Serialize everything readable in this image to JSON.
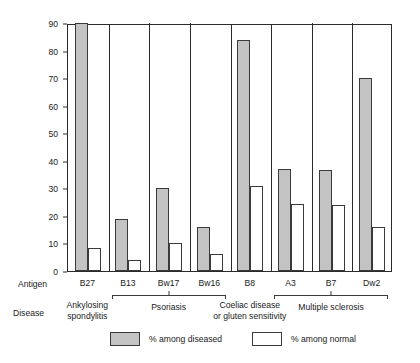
{
  "chart_data": {
    "type": "bar",
    "title": "",
    "xlabel": "",
    "ylabel": "Percentage having antigen",
    "ylim": [
      0,
      90
    ],
    "ytick_labels": [
      "0",
      "10",
      "20",
      "30",
      "40",
      "50",
      "60",
      "70",
      "80",
      "90"
    ],
    "yticks": [
      0,
      10,
      20,
      30,
      40,
      50,
      60,
      70,
      80,
      90
    ],
    "grid": false,
    "legend_position": "bottom",
    "categories": [
      "B27",
      "B13",
      "Bw17",
      "Bw16",
      "B8",
      "A3",
      "B7",
      "Dw2"
    ],
    "series": [
      {
        "name": "% among diseased",
        "color": "#c3c3c3",
        "values": [
          90,
          19,
          30,
          16,
          84,
          37,
          36.5,
          70
        ]
      },
      {
        "name": "% among normal",
        "color": "#ffffff",
        "values": [
          8.5,
          4,
          10,
          6,
          31,
          24.5,
          24,
          16
        ]
      }
    ],
    "row_labels": {
      "antigen": "Antigen",
      "disease": "Disease"
    },
    "groups": [
      {
        "disease": "Ankylosing\nspondylitis",
        "antigens": [
          "B27"
        ],
        "bracket": false
      },
      {
        "disease": "Psoriasis",
        "antigens": [
          "B13",
          "Bw17",
          "Bw16"
        ],
        "bracket": true
      },
      {
        "disease": "Coeliac disease\nor gluten sensitivity",
        "antigens": [
          "B8"
        ],
        "bracket": false
      },
      {
        "disease": "Multiple sclerosis",
        "antigens": [
          "A3",
          "B7",
          "Dw2"
        ],
        "bracket": true
      }
    ]
  }
}
